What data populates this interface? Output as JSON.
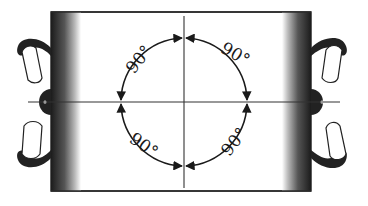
{
  "figure": {
    "angle_labels": {
      "top_left": "90°",
      "top_right": "90°",
      "bottom_left": "90°",
      "bottom_right": "90°"
    },
    "colors": {
      "ink": "#1a1a1a",
      "paper": "#ffffff",
      "roller_shade": "#2a2a2a"
    }
  }
}
